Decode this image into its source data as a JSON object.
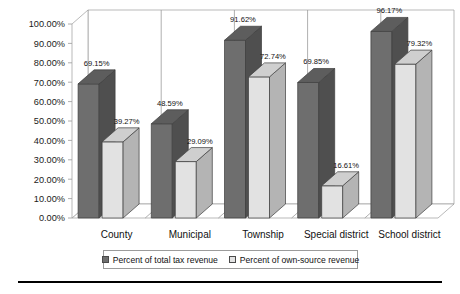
{
  "chart_data": {
    "type": "bar",
    "title": "",
    "subtitle": "",
    "xlabel": "",
    "ylabel": "",
    "ylim": [
      0,
      1.0
    ],
    "grid": false,
    "legend_position": "bottom",
    "three_d": true,
    "categories": [
      "County",
      "Municipal",
      "Township",
      "Special district",
      "School district"
    ],
    "ytick_labels": [
      "100.00%",
      "90.00%",
      "80.00%",
      "70.00%",
      "60.00%",
      "50.00%",
      "40.00%",
      "30.00%",
      "20.00%",
      "10.00%",
      "0.00%"
    ],
    "ytick_values": [
      100,
      90,
      80,
      70,
      60,
      50,
      40,
      30,
      20,
      10,
      0
    ],
    "series": [
      {
        "name": "Percent of total tax revenue",
        "color": "#6e6e6e",
        "values": [
          69.15,
          48.59,
          91.62,
          69.85,
          96.17
        ],
        "labels": [
          "69.15%",
          "48.59%",
          "91.62%",
          "69.85%",
          "96.17%"
        ]
      },
      {
        "name": "Percent of own-source revenue",
        "color": "#e2e2e2",
        "values": [
          39.27,
          29.09,
          72.74,
          16.61,
          79.32
        ],
        "labels": [
          "39.27%",
          "29.09%",
          "72.74%",
          "16.61%",
          "79.32%"
        ]
      }
    ]
  },
  "legend": {
    "entries": [
      {
        "label": "Percent of total tax revenue",
        "swatch": "dark"
      },
      {
        "label": "Percent of own-source revenue",
        "swatch": "light"
      }
    ]
  },
  "colors": {
    "series_dark": "#6e6e6e",
    "series_dark_side": "#4f4f4f",
    "series_dark_top": "#5d5d5d",
    "series_light": "#e2e2e2",
    "series_light_side": "#b4b4b4",
    "series_light_top": "#cfcfcf",
    "axis": "#9b9b9b",
    "text": "#111111",
    "rule": "#000000"
  }
}
